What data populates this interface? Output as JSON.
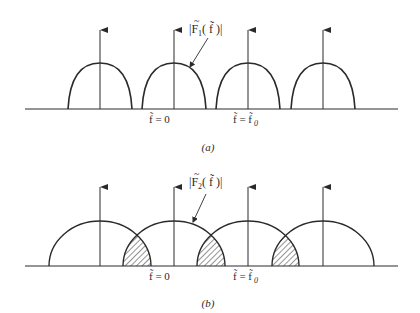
{
  "figure": {
    "panels": [
      {
        "id": "a",
        "caption": "(a)",
        "curve_label": {
          "prefix": "|F",
          "tilde": "~",
          "subscript": "1",
          "suffix": "( f̃ )|"
        },
        "tick_labels": [
          {
            "text": "f̃ = 0"
          },
          {
            "text": "f̃ = f̃",
            "subscript": "0"
          }
        ],
        "lobe_centers_x": [
          100,
          174,
          248,
          323
        ],
        "lobe_half_width": 32,
        "overlap": false
      },
      {
        "id": "b",
        "caption": "(b)",
        "curve_label": {
          "prefix": "|F",
          "tilde": "~",
          "subscript": "2",
          "suffix": "( f̃ )|"
        },
        "tick_labels": [
          {
            "text": "f̃ = 0"
          },
          {
            "text": "f̃ = f̃",
            "subscript": "0"
          }
        ],
        "lobe_centers_x": [
          100,
          174,
          248,
          323
        ],
        "lobe_half_width": 51,
        "overlap": true,
        "overlap_regions": "hatched (aliasing)"
      }
    ],
    "colors": {
      "ink": "#2a2a2a",
      "background": "#ffffff"
    }
  }
}
